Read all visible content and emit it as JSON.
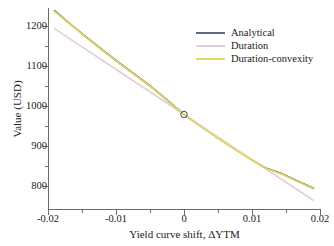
{
  "chart_data": {
    "type": "line",
    "title": "",
    "xlabel": "Yield curve shift, ΔYTM",
    "ylabel": "Value (USD)",
    "xlim": [
      -0.021,
      0.021
    ],
    "ylim": [
      780,
      1248
    ],
    "grid": false,
    "legend_position": "top-right",
    "x_ticks": [
      -0.02,
      -0.01,
      0,
      0.01,
      0.02
    ],
    "x_tick_labels": [
      "-0.02",
      "-0.01",
      "0",
      "0.01",
      "0.02"
    ],
    "x_minor_ticks": [
      -0.015,
      -0.005,
      0.005,
      0.015
    ],
    "y_ticks": [
      800,
      900,
      1000,
      1100,
      1200
    ],
    "y_tick_labels": [
      "800",
      "900",
      "1000",
      "1100",
      "1200"
    ],
    "y_minor_ticks": [
      850,
      950,
      1050,
      1150
    ],
    "x": [
      -0.02,
      -0.0175,
      -0.015,
      -0.0125,
      -0.01,
      -0.0075,
      -0.005,
      -0.0025,
      0,
      0.0025,
      0.005,
      0.0075,
      0.01,
      0.0125,
      0.015,
      0.0175,
      0.02
    ],
    "series": [
      {
        "name": "Analytical",
        "color": "#5b6b8c",
        "values": [
          1242,
          1210,
          1179,
          1149,
          1120,
          1092,
          1064,
          1032,
          1000,
          974,
          948,
          923,
          899,
          876,
          863,
          845,
          828
        ]
      },
      {
        "name": "Duration",
        "color": "#e3cfd9",
        "values": [
          1200,
          1175,
          1150,
          1125,
          1100,
          1075,
          1050,
          1025,
          1000,
          975,
          950,
          925,
          900,
          875,
          850,
          825,
          800
        ]
      },
      {
        "name": "Duration-convexity",
        "color": "#e3d95c",
        "values": [
          1240,
          1209,
          1178,
          1148,
          1119,
          1091,
          1063,
          1031,
          1000,
          973,
          947,
          922,
          898,
          875,
          862,
          844,
          827
        ]
      }
    ],
    "markers": [
      {
        "name": "base-point",
        "x": 0,
        "y": 1000,
        "shape": "circle-open"
      }
    ]
  }
}
